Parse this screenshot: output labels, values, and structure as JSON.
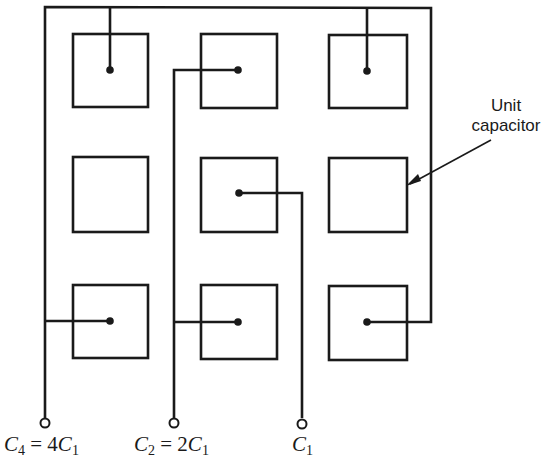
{
  "diagram": {
    "colors": {
      "stroke": "#1a1a1a",
      "background": "#ffffff"
    },
    "annotation": {
      "line1": "Unit",
      "line2": "capacitor"
    },
    "terminals": [
      {
        "id": "c4",
        "sym": "C",
        "sub": "4",
        "eq": " = 4",
        "sym2": "C",
        "sub2": "1"
      },
      {
        "id": "c2",
        "sym": "C",
        "sub": "2",
        "eq": " = 2",
        "sym2": "C",
        "sub2": "1"
      },
      {
        "id": "c1",
        "sym": "C",
        "sub": "1"
      }
    ],
    "grid": {
      "rows": 3,
      "cols": 3
    },
    "connections": {
      "C4": [
        "row1-col1",
        "row1-col3",
        "row3-col1",
        "row3-col3"
      ],
      "C2": [
        "row1-col2",
        "row3-col2"
      ],
      "C1": [
        "row2-col2"
      ],
      "unconnected": [
        "row2-col1",
        "row2-col3"
      ]
    }
  }
}
